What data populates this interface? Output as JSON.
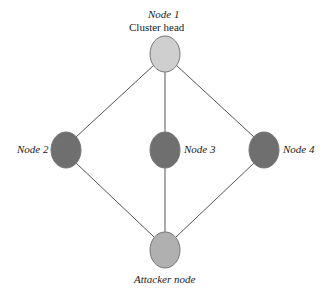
{
  "diagram": {
    "nodes": [
      {
        "id": "node1",
        "label": "Node 1",
        "sublabel": "Cluster head",
        "cx": 165,
        "cy": 54,
        "fill": "#cccccc"
      },
      {
        "id": "node2",
        "label": "Node 2",
        "cx": 66,
        "cy": 150,
        "fill": "#6f6f6f"
      },
      {
        "id": "node3",
        "label": "Node 3",
        "cx": 165,
        "cy": 150,
        "fill": "#6f6f6f"
      },
      {
        "id": "node4",
        "label": "Node 4",
        "cx": 264,
        "cy": 150,
        "fill": "#6f6f6f"
      },
      {
        "id": "attacker",
        "label": "Attacker node",
        "cx": 165,
        "cy": 250,
        "fill": "#b0b0b0"
      }
    ],
    "edges": [
      [
        "node1",
        "node2"
      ],
      [
        "node1",
        "node3"
      ],
      [
        "node1",
        "node4"
      ],
      [
        "node2",
        "attacker"
      ],
      [
        "node3",
        "attacker"
      ],
      [
        "node4",
        "attacker"
      ]
    ]
  }
}
